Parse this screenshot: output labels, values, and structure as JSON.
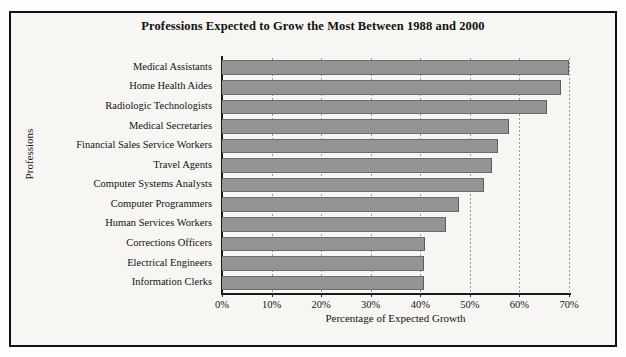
{
  "figure": {
    "title": "Professions Expected to Grow the Most Between 1988 and 2000",
    "frame_color": "#111111",
    "background_color": "#f7f6f3",
    "bar_color": "#949494",
    "bar_edge_color": "#6b6b6b",
    "gridline_color": "#9a9a9a",
    "axis_color": "#1a1a1a"
  },
  "chart_data": {
    "type": "bar",
    "orientation": "horizontal",
    "title": "Professions Expected to Grow the Most Between 1988 and 2000",
    "xlabel": "Percentage of Expected Growth",
    "ylabel": "Professions",
    "xlim": [
      0,
      70
    ],
    "ylim": null,
    "grid": true,
    "grid_axis": "x",
    "grid_style": "dotted",
    "legend": false,
    "legend_position": "none",
    "xtick_labels": [
      "0%",
      "10%",
      "20%",
      "30%",
      "40%",
      "50%",
      "60%",
      "70%"
    ],
    "xtick_values": [
      0,
      10,
      20,
      30,
      40,
      50,
      60,
      70
    ],
    "categories": [
      "Medical Assistants",
      "Home Health Aides",
      "Radiologic Technologists",
      "Medical Secretaries",
      "Financial Sales Service Workers",
      "Travel Agents",
      "Computer Systems Analysts",
      "Computer Programmers",
      "Human Services Workers",
      "Corrections Officers",
      "Electrical Engineers",
      "Information Clerks"
    ],
    "values": [
      70,
      68.3,
      65.6,
      57.8,
      55.6,
      54.5,
      52.8,
      47.8,
      45.1,
      41.0,
      40.7,
      40.8
    ],
    "units": "percent"
  }
}
